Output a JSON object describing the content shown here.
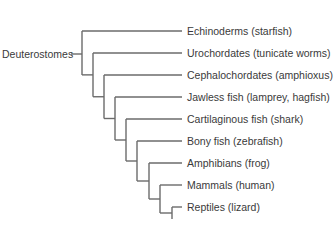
{
  "diagram": {
    "type": "cladogram",
    "line_color": "#6b6b6b",
    "text_color": "#3a3a3a",
    "top_clipped_text": "",
    "root": {
      "label": "Deuterostomes"
    },
    "leaves": [
      {
        "label": "Echinoderms (starfish)"
      },
      {
        "label": "Urochordates (tunicate worms)"
      },
      {
        "label": "Cephalochordates (amphioxus)"
      },
      {
        "label": "Jawless fish (lamprey, hagfish)"
      },
      {
        "label": "Cartilaginous fish (shark)"
      },
      {
        "label": "Bony fish (zebrafish)"
      },
      {
        "label": "Amphibians (frog)"
      },
      {
        "label": "Mammals (human)"
      },
      {
        "label": "Reptiles (lizard)"
      }
    ]
  }
}
